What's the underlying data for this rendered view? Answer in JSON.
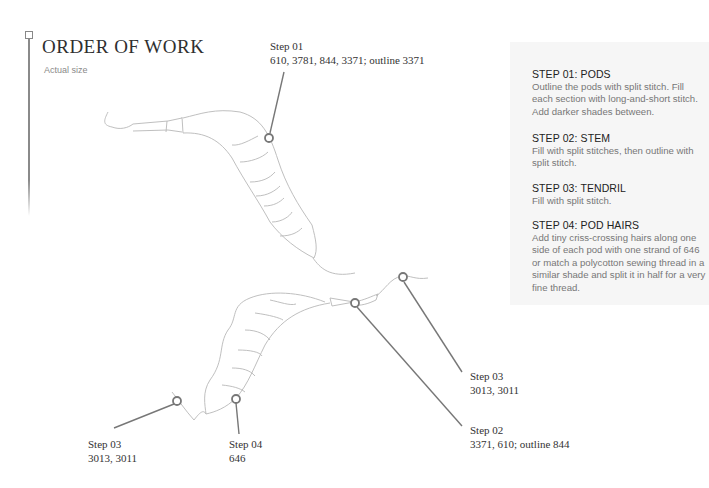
{
  "header": {
    "title": "ORDER OF WORK",
    "subtitle": "Actual size"
  },
  "callouts": [
    {
      "id": "step01",
      "title": "Step 01",
      "threads": "610, 3781, 844, 3371; outline 3371"
    },
    {
      "id": "step03-upper",
      "title": "Step 03",
      "threads": "3013, 3011"
    },
    {
      "id": "step02",
      "title": "Step 02",
      "threads": "3371, 610; outline 844"
    },
    {
      "id": "step03-lower",
      "title": "Step 03",
      "threads": "3013, 3011"
    },
    {
      "id": "step04",
      "title": "Step 04",
      "threads": "646"
    }
  ],
  "instructions": [
    {
      "heading": "STEP 01: PODS",
      "text": "Outline the pods with split stitch. Fill each section with long-and-short stitch. Add darker shades between."
    },
    {
      "heading": "STEP 02: STEM",
      "text": "Fill with split stitches, then outline with split stitch."
    },
    {
      "heading": "STEP 03: TENDRIL",
      "text": "Fill with split stitch."
    },
    {
      "heading": "STEP 04: POD HAIRS",
      "text": "Add tiny criss-crossing hairs along one side of each pod with one strand of 646 or match a polycotton sewing thread in a similar shade and split it in half for a very fine thread."
    }
  ],
  "colors": {
    "leader_line": "#7a7a7a",
    "drawing_line": "#b8b8b8",
    "panel_bg": "#f6f6f6"
  }
}
